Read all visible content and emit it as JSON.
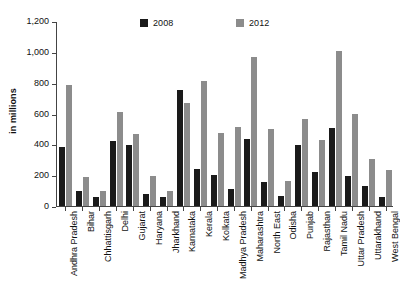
{
  "chart_data": {
    "type": "bar",
    "title": "",
    "xlabel": "",
    "ylabel": "in millions",
    "ylim": [
      0,
      1200
    ],
    "ytick_values": [
      0,
      200,
      400,
      600,
      800,
      1000,
      1200
    ],
    "ytick_labels": [
      "0",
      "200",
      "400",
      "600",
      "800",
      "1,000",
      "1,200"
    ],
    "grid": false,
    "legend_position": "top-center",
    "categories": [
      "Andhra Pradesh",
      "Bihar",
      "Chhattisgarh",
      "Delhi",
      "Gujarat",
      "Haryana",
      "Jharkhand",
      "Karnataka",
      "Kerala",
      "Kolkata",
      "Madhya Pradesh",
      "Maharashtra",
      "North East",
      "Odisha",
      "Punjab",
      "Rajasthan",
      "Tamil Nadu",
      "Uttar Pradesh",
      "Uttarakhand",
      "West Bengal"
    ],
    "series": [
      {
        "name": "2008",
        "color": "#1a1a1a",
        "values": [
          385,
          95,
          58,
          422,
          397,
          75,
          57,
          752,
          242,
          200,
          113,
          433,
          158,
          67,
          397,
          220,
          505,
          197,
          130,
          60
        ]
      },
      {
        "name": "2012",
        "color": "#8c8c8c",
        "values": [
          785,
          185,
          100,
          610,
          468,
          193,
          100,
          667,
          812,
          475,
          512,
          967,
          497,
          163,
          562,
          430,
          1005,
          600,
          308,
          232
        ]
      }
    ]
  },
  "legend": {
    "entries": [
      {
        "label": "2008",
        "color": "#1a1a1a"
      },
      {
        "label": "2012",
        "color": "#8c8c8c"
      }
    ]
  },
  "axes": {
    "y_title": "in millions"
  }
}
